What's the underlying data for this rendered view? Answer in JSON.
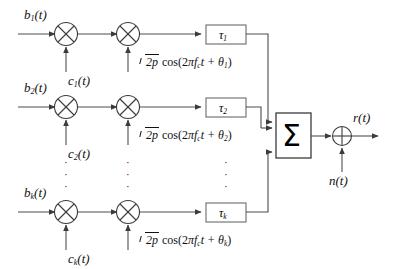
{
  "diagram": {
    "line_color": "#4d4d4d",
    "box_border_color": "#6b6b6b",
    "text_color": "#111111",
    "background": "#ffffff"
  },
  "branches": [
    {
      "id": "branch-1",
      "data_label": "b",
      "data_sub": "1",
      "data_suffix": "(t)",
      "code_label": "c",
      "code_sub": "1",
      "code_suffix": "(t)",
      "carrier_amp": "2p",
      "carrier_expr_head": "cos(2",
      "carrier_pi": "π",
      "carrier_f": "f",
      "carrier_f_sub": "c",
      "carrier_t": "t +",
      "carrier_theta": "θ",
      "carrier_theta_sub": "1",
      "carrier_expr_tail": ")",
      "delay_symbol": "τ",
      "delay_sub": "1"
    },
    {
      "id": "branch-2",
      "data_label": "b",
      "data_sub": "2",
      "data_suffix": "(t)",
      "code_label": "c",
      "code_sub": "2",
      "code_suffix": "(t)",
      "carrier_amp": "2p",
      "carrier_expr_head": "cos(2",
      "carrier_pi": "π",
      "carrier_f": "f",
      "carrier_f_sub": "c",
      "carrier_t": "t +",
      "carrier_theta": "θ",
      "carrier_theta_sub": "2",
      "carrier_expr_tail": ")",
      "delay_symbol": "τ",
      "delay_sub": "2"
    },
    {
      "id": "branch-k",
      "data_label": "b",
      "data_sub": "k",
      "data_suffix": "(t)",
      "code_label": "c",
      "code_sub": "k",
      "code_suffix": "(t)",
      "carrier_amp": "2p",
      "carrier_expr_head": "cos(2",
      "carrier_pi": "π",
      "carrier_f": "f",
      "carrier_f_sub": "c",
      "carrier_t": "t +",
      "carrier_theta": "θ",
      "carrier_theta_sub": "k",
      "carrier_expr_tail": ")",
      "delay_symbol": "τ",
      "delay_sub": "k"
    }
  ],
  "summer": {
    "symbol": "Σ",
    "name": "summation-block"
  },
  "adder": {
    "symbol": "⊕",
    "name": "noise-adder"
  },
  "noise": {
    "label": "n",
    "suffix": "(t)"
  },
  "output": {
    "label": "r",
    "suffix": "(t)"
  },
  "multiplier": {
    "symbol": "⊗"
  },
  "ellipsis": {
    "dots": "·"
  }
}
